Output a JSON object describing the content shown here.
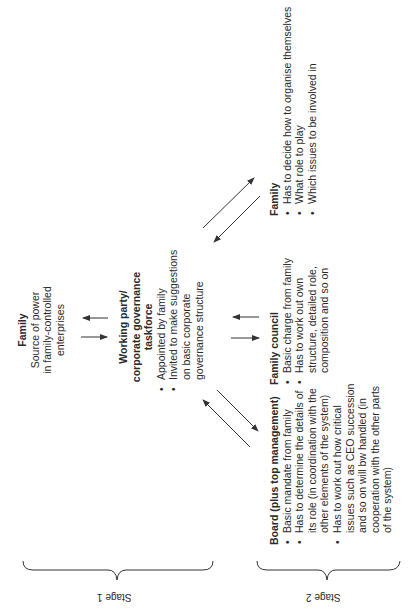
{
  "diagram": {
    "stage1": {
      "label": "Stage 1",
      "family": {
        "title": "Family",
        "lines": [
          "Source of power",
          "in family-controlled",
          "enterprises"
        ]
      },
      "working_party": {
        "title_lines": [
          "Working party/",
          "corporate governance",
          "taskforce"
        ],
        "bullets": [
          "Appointed by family",
          "Invited to make suggestions",
          "on basic corporate",
          "governance structure"
        ]
      }
    },
    "stage2": {
      "label": "Stage 2",
      "board": {
        "title": "Board (plus top management)",
        "bullets": [
          [
            "Basic mandate from family"
          ],
          [
            "Has to determine the details of",
            "its role (in coordination with the",
            "other elements of the system)"
          ],
          [
            "Has to work out how critical",
            "issues such as CEO succession",
            "and so on will bw handled (in",
            "cooperation with the other parts",
            "of the system)"
          ]
        ]
      },
      "family_council": {
        "title": "Family council",
        "bullets": [
          [
            "Basic charge from family"
          ],
          [
            "Has to work out own",
            "structure, detailed role,",
            "composition and so on"
          ]
        ]
      },
      "family": {
        "title": "Family",
        "bullets": [
          [
            "Has to decide how to organise themselves"
          ],
          [
            "What role to play"
          ],
          [
            "Which issues to be involved in"
          ]
        ]
      }
    },
    "colors": {
      "text": "#2a2a2a",
      "lines": "#333333",
      "background": "#ffffff"
    }
  }
}
